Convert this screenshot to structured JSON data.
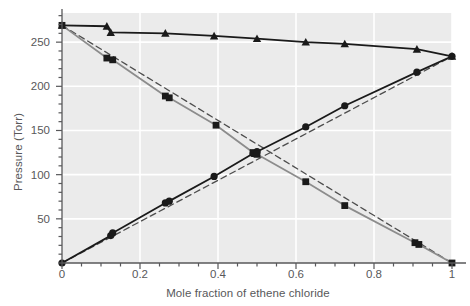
{
  "chart_data": {
    "type": "line",
    "title": "",
    "xlabel": "Mole fraction of ethene chloride",
    "ylabel": "Pressure (Torr)",
    "xlim": [
      0,
      1
    ],
    "ylim": [
      0,
      283
    ],
    "xticks": [
      0,
      0.2,
      0.4,
      0.6,
      0.8,
      1
    ],
    "xticklabels": [
      "0",
      "0.2",
      "0.4",
      "0.6",
      "0.8",
      "1"
    ],
    "xminor_step": 0.05,
    "yticks": [
      50,
      100,
      150,
      200,
      250
    ],
    "yticklabels": [
      "50",
      "100",
      "150",
      "200",
      "250"
    ],
    "yminor_step": 10,
    "grid": "white gridlines on light gray panel, major ticks only",
    "legend": "none",
    "plot_bgcolor": "#ebebeb",
    "gridline_color": "#ffffff",
    "axis_color": "#58585a",
    "series": [
      {
        "name": "Total pressure",
        "marker": "triangle",
        "line_style": "solid",
        "color": "#1a1a1a",
        "x": [
          0,
          0.115,
          0.125,
          0.265,
          0.39,
          0.5,
          0.625,
          0.725,
          0.91,
          1.0
        ],
        "y": [
          269,
          268,
          261,
          260,
          257,
          254,
          250,
          248,
          242,
          234
        ]
      },
      {
        "name": "Partial pressure of ethene chloride",
        "marker": "circle",
        "line_style": "solid",
        "color": "#1a1a1a",
        "x": [
          0,
          0.125,
          0.13,
          0.265,
          0.275,
          0.39,
          0.49,
          0.5,
          0.625,
          0.725,
          0.91,
          1.0
        ],
        "y": [
          0,
          31,
          34,
          68,
          70,
          98,
          124,
          126,
          154,
          178,
          216,
          234
        ]
      },
      {
        "name": "Partial pressure of 2,2-dimethylbutane",
        "marker": "square",
        "line_style": "solid",
        "color": "#8c8c8c",
        "x": [
          0,
          0.115,
          0.13,
          0.265,
          0.275,
          0.395,
          0.49,
          0.5,
          0.625,
          0.725,
          0.905,
          0.915,
          1.0
        ],
        "y": [
          269,
          232,
          230,
          189,
          187,
          156,
          125,
          123,
          92,
          65,
          23,
          21,
          0
        ]
      },
      {
        "name": "Raoult's law ideal line (ethene chloride)",
        "marker": "none",
        "line_style": "dashed",
        "color": "#4d4d4d",
        "x": [
          0,
          1
        ],
        "y": [
          0,
          234
        ]
      },
      {
        "name": "Raoult's law ideal line (2,2-dimethylbutane)",
        "marker": "none",
        "line_style": "dashed",
        "color": "#4d4d4d",
        "x": [
          0,
          1
        ],
        "y": [
          269,
          0
        ]
      }
    ]
  }
}
